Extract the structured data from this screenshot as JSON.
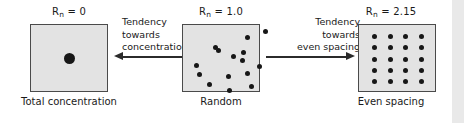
{
  "figure": {
    "title_symbol_base": "R",
    "title_symbol_sub": "n",
    "panels": [
      {
        "id": "total-concentration",
        "value_label": " = 0",
        "caption": "Total concentration",
        "pattern": "single-center-dot",
        "dot_count": 1
      },
      {
        "id": "random",
        "value_label": " = 1.0",
        "caption": "Random",
        "pattern": "random-scatter",
        "dot_count": 15
      },
      {
        "id": "even-spacing",
        "value_label": " = 2.15",
        "caption": "Even spacing",
        "pattern": "regular-grid",
        "dot_count": 20,
        "grid_cols": 4,
        "grid_rows": 5
      }
    ],
    "arrows": [
      {
        "id": "to-concentration",
        "direction": "left",
        "label_lines": [
          "Tendency",
          "towards",
          "concentration"
        ]
      },
      {
        "id": "to-even-spacing",
        "direction": "right",
        "label_lines": [
          "Tendency",
          "towards",
          "even spacing"
        ]
      }
    ],
    "colors": {
      "panel_fill": "#e3e3e3",
      "panel_border": "#4a4a4a",
      "dot": "#171717",
      "arrow": "#2b2b2b",
      "text": "#1a1a1a",
      "edge_strip": "#e9e9e9",
      "background": "#ffffff"
    },
    "random_dots": [
      [
        62,
        10
      ],
      [
        80,
        4
      ],
      [
        30,
        20
      ],
      [
        33,
        23
      ],
      [
        48,
        29
      ],
      [
        58,
        25
      ],
      [
        57,
        33
      ],
      [
        11,
        38
      ],
      [
        43,
        49
      ],
      [
        62,
        46
      ],
      [
        74,
        39
      ],
      [
        24,
        57
      ],
      [
        44,
        63
      ],
      [
        66,
        59
      ],
      [
        14,
        47
      ]
    ]
  }
}
